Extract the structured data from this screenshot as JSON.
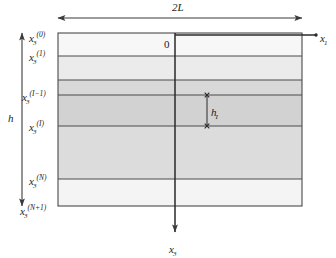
{
  "figure": {
    "background_color": "#ffffff",
    "line_color": "#3b3b3b",
    "text_color": "#1b1b1b"
  },
  "axes": {
    "horizontal": {
      "label_base": "x",
      "label_sub": "1",
      "name": "x1-axis",
      "direction": "right"
    },
    "vertical": {
      "label_base": "x",
      "label_sub": "3",
      "name": "x3-axis",
      "direction": "down"
    },
    "origin_label": "0"
  },
  "dimensions": {
    "width_label": "2L",
    "height_label": "h",
    "layer_thickness_base": "h",
    "layer_thickness_sub": "I"
  },
  "interfaces": [
    {
      "id": "top",
      "base": "x",
      "sub": "3",
      "sup": "(0)",
      "y": 33
    },
    {
      "id": "first",
      "base": "x",
      "sub": "3",
      "sup": "(1)",
      "y": 56
    },
    {
      "id": "i-minus-1",
      "base": "x",
      "sub": "3",
      "sup": "(I−1)",
      "y": 95
    },
    {
      "id": "i",
      "base": "x",
      "sub": "3",
      "sup": "(I)",
      "y": 126
    },
    {
      "id": "n",
      "base": "x",
      "sub": "3",
      "sup": "(N)",
      "y": 179
    },
    {
      "id": "n-plus-1",
      "base": "x",
      "sub": "3",
      "sup": "(N+1)",
      "y": 206
    }
  ],
  "bands": [
    {
      "name": "band-0",
      "y_top": 33,
      "y_bottom": 56,
      "fill": "#f7f7f7"
    },
    {
      "name": "band-1",
      "y_top": 56,
      "y_bottom": 80,
      "fill": "#ebebeb"
    },
    {
      "name": "band-2",
      "y_top": 80,
      "y_bottom": 95,
      "fill": "#d8d8d8"
    },
    {
      "name": "band-3",
      "y_top": 95,
      "y_bottom": 126,
      "fill": "#d2d2d2"
    },
    {
      "name": "band-4",
      "y_top": 126,
      "y_bottom": 179,
      "fill": "#dcdcdc"
    },
    {
      "name": "band-5",
      "y_top": 179,
      "y_bottom": 206,
      "fill": "#f4f4f4"
    }
  ],
  "geometry": {
    "rect_left": 58,
    "rect_right": 302,
    "rect_top": 33,
    "rect_bottom": 206,
    "axis_x": 175,
    "x1_arrow_end": 316,
    "x3_arrow_end": 232,
    "width_arrow_y": 18,
    "width_arrow_left": 58,
    "width_arrow_right": 302,
    "height_arrow_x": 22,
    "hi_arrow_x": 207,
    "hi_arrow_top": 95,
    "hi_arrow_bottom": 126
  }
}
